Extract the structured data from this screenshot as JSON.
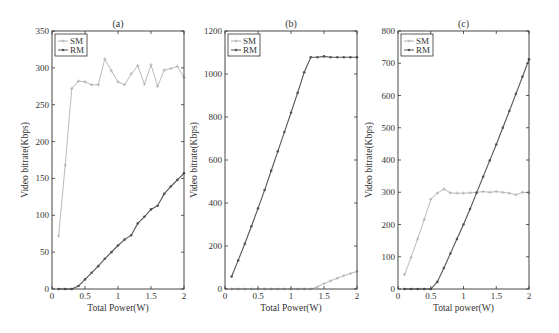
{
  "chart_data": [
    {
      "type": "line",
      "title": "(a)",
      "xlabel": "Total Power(W)",
      "ylabel": "Video bitrate(Kbps)",
      "xlim": [
        0,
        2
      ],
      "ylim": [
        0,
        350
      ],
      "xticks": [
        0,
        0.5,
        1,
        1.5,
        2
      ],
      "xtick_labels": [
        "0",
        "0.5",
        "1",
        "1.5",
        "2"
      ],
      "yticks": [
        0,
        50,
        100,
        150,
        200,
        250,
        300,
        350
      ],
      "ytick_labels": [
        "0",
        "50",
        "100",
        "150",
        "200",
        "250",
        "300",
        "350"
      ],
      "legend": [
        "SM",
        "RM"
      ],
      "legend_position": "upper left",
      "grid": false,
      "x": [
        0.1,
        0.2,
        0.3,
        0.4,
        0.5,
        0.6,
        0.7,
        0.8,
        0.9,
        1.0,
        1.1,
        1.2,
        1.3,
        1.4,
        1.5,
        1.6,
        1.7,
        1.8,
        1.9,
        2.0
      ],
      "series": [
        {
          "name": "SM",
          "color": "#b0b0b0",
          "values": [
            72,
            168,
            272,
            282,
            281,
            277,
            277,
            312,
            296,
            281,
            277,
            292,
            303,
            278,
            304,
            275,
            297,
            299,
            302,
            287
          ]
        },
        {
          "name": "RM",
          "color": "#555555",
          "values": [
            0,
            0,
            0,
            4,
            13,
            22,
            31,
            41,
            50,
            59,
            67,
            73,
            89,
            98,
            108,
            113,
            129,
            139,
            148,
            157
          ]
        }
      ]
    },
    {
      "type": "line",
      "title": "(b)",
      "xlabel": "Total Power(W)",
      "ylabel": "Video bitrate(Kbps)",
      "xlim": [
        0,
        2
      ],
      "ylim": [
        0,
        1200
      ],
      "xticks": [
        0,
        0.5,
        1,
        1.5,
        2
      ],
      "xtick_labels": [
        "0",
        "0.5",
        "1",
        "1.5",
        "2"
      ],
      "yticks": [
        0,
        200,
        400,
        600,
        800,
        1000,
        1200
      ],
      "ytick_labels": [
        "0",
        "200",
        "400",
        "600",
        "800",
        "1000",
        "1200"
      ],
      "legend": [
        "SM",
        "RM"
      ],
      "legend_position": "upper left",
      "grid": false,
      "x": [
        0.1,
        0.2,
        0.3,
        0.4,
        0.5,
        0.6,
        0.7,
        0.8,
        0.9,
        1.0,
        1.1,
        1.2,
        1.3,
        1.4,
        1.5,
        1.6,
        1.7,
        1.8,
        1.9,
        2.0
      ],
      "series": [
        {
          "name": "SM",
          "color": "#b0b0b0",
          "values": [
            0,
            0,
            0,
            0,
            0,
            0,
            0,
            0,
            0,
            0,
            0,
            0,
            0,
            10,
            25,
            38,
            50,
            62,
            72,
            82
          ]
        },
        {
          "name": "RM",
          "color": "#555555",
          "values": [
            58,
            133,
            210,
            292,
            375,
            460,
            550,
            640,
            730,
            820,
            912,
            1008,
            1078,
            1078,
            1082,
            1078,
            1078,
            1078,
            1078,
            1078
          ]
        }
      ]
    },
    {
      "type": "line",
      "title": "(c)",
      "xlabel": "Total power(W)",
      "ylabel": "Video bitrate(Kbps)",
      "xlim": [
        0,
        2
      ],
      "ylim": [
        0,
        800
      ],
      "xticks": [
        0,
        0.5,
        1,
        1.5,
        2
      ],
      "xtick_labels": [
        "0",
        "0.5",
        "1",
        "1.5",
        "2"
      ],
      "yticks": [
        0,
        100,
        200,
        300,
        400,
        500,
        600,
        700,
        800
      ],
      "ytick_labels": [
        "0",
        "100",
        "200",
        "300",
        "400",
        "500",
        "600",
        "700",
        "800"
      ],
      "legend": [
        "SM",
        "RM"
      ],
      "legend_position": "upper left",
      "grid": false,
      "x": [
        0.1,
        0.2,
        0.3,
        0.4,
        0.5,
        0.6,
        0.7,
        0.8,
        0.9,
        1.0,
        1.1,
        1.2,
        1.3,
        1.4,
        1.5,
        1.6,
        1.7,
        1.8,
        1.9,
        2.0
      ],
      "series": [
        {
          "name": "SM",
          "color": "#b0b0b0",
          "values": [
            45,
            98,
            155,
            215,
            278,
            297,
            310,
            298,
            297,
            297,
            298,
            300,
            302,
            300,
            302,
            300,
            297,
            292,
            300,
            298
          ]
        },
        {
          "name": "RM",
          "color": "#555555",
          "values": [
            0,
            0,
            0,
            0,
            0,
            22,
            65,
            110,
            155,
            200,
            248,
            298,
            348,
            398,
            448,
            500,
            552,
            605,
            658,
            712
          ]
        }
      ]
    }
  ],
  "layout": {
    "panels": [
      {
        "left": 52,
        "right": 184,
        "top": 31,
        "bottom": 289
      },
      {
        "left": 225,
        "right": 357,
        "top": 31,
        "bottom": 289
      },
      {
        "left": 398,
        "right": 529,
        "top": 31,
        "bottom": 289
      }
    ]
  }
}
